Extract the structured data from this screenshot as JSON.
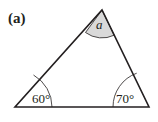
{
  "figure": {
    "label": "(a)",
    "colors": {
      "line": "#231f20",
      "shade": "#d9d9d9"
    },
    "angles": {
      "top": "a",
      "bottom_left": "60°",
      "bottom_right": "70°"
    }
  }
}
